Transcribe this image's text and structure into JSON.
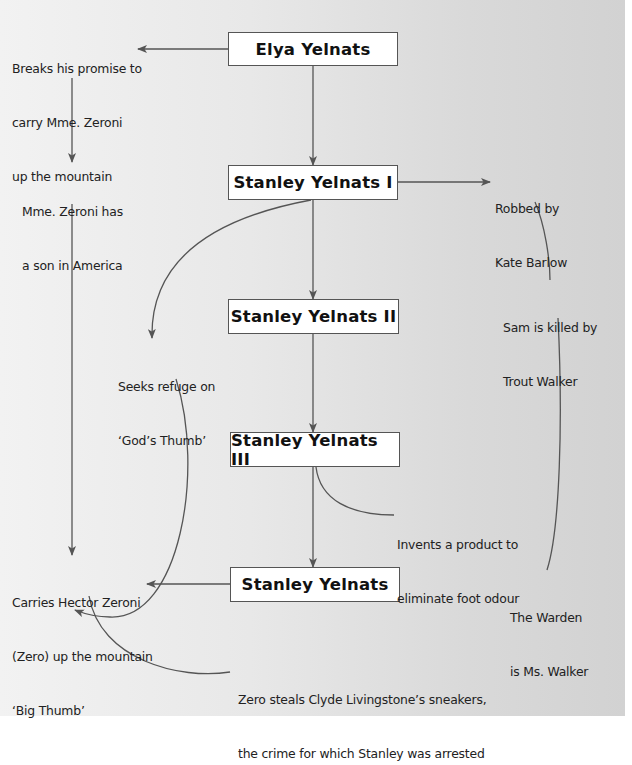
{
  "diagram": {
    "type": "family-tree-flowchart",
    "colors": {
      "background_light": "#f2f2f2",
      "background_dark": "#d2d2d2",
      "box_fill": "#ffffff",
      "box_border": "#555555",
      "line": "#555555",
      "text": "#222222"
    },
    "generations": [
      {
        "id": "elya",
        "label": "Elya Yelnats"
      },
      {
        "id": "sy1",
        "label": "Stanley Yelnats I"
      },
      {
        "id": "sy2",
        "label": "Stanley Yelnats II"
      },
      {
        "id": "sy3",
        "label": "Stanley Yelnats III"
      },
      {
        "id": "sy4",
        "label": "Stanley Yelnats"
      }
    ],
    "notes": {
      "breaks_promise": [
        "Breaks his promise to",
        "carry Mme. Zeroni",
        "up the mountain"
      ],
      "son_in_america": [
        "Mme. Zeroni has",
        "a son in America"
      ],
      "carries_hector": [
        "Carries Hector Zeroni",
        "(Zero) up the mountain",
        "‘Big Thumb’"
      ],
      "robbed": [
        "Robbed by",
        "Kate Barlow"
      ],
      "seeks_refuge": [
        "Seeks refuge on",
        "‘God’s Thumb’"
      ],
      "sam_killed": [
        "Sam is killed by",
        "Trout Walker"
      ],
      "invents_product": [
        "Invents a product to",
        "eliminate foot odour"
      ],
      "warden": [
        "The Warden",
        "is Ms. Walker"
      ],
      "zero_steals": [
        "Zero steals Clyde Livingstone’s sneakers,",
        "the crime for which Stanley was arrested"
      ]
    },
    "connections": [
      {
        "from": "Elya Yelnats",
        "to": "Breaks his promise to carry Mme. Zeroni up the mountain",
        "style": "arrow"
      },
      {
        "from": "Breaks his promise to carry Mme. Zeroni up the mountain",
        "to": "Mme. Zeroni has a son in America",
        "style": "arrow"
      },
      {
        "from": "Mme. Zeroni has a son in America",
        "to": "Carries Hector Zeroni (Zero) up the mountain ‘Big Thumb’",
        "style": "arrow"
      },
      {
        "from": "Elya Yelnats",
        "to": "Stanley Yelnats I",
        "style": "arrow"
      },
      {
        "from": "Stanley Yelnats I",
        "to": "Robbed by Kate Barlow",
        "style": "arrow"
      },
      {
        "from": "Stanley Yelnats I",
        "to": "Seeks refuge on ‘God’s Thumb’",
        "style": "curved-arrow"
      },
      {
        "from": "Stanley Yelnats I",
        "to": "Stanley Yelnats II",
        "style": "arrow"
      },
      {
        "from": "Stanley Yelnats II",
        "to": "Stanley Yelnats III",
        "style": "arrow"
      },
      {
        "from": "Stanley Yelnats III",
        "to": "Invents a product to eliminate foot odour",
        "style": "curve"
      },
      {
        "from": "Stanley Yelnats III",
        "to": "Stanley Yelnats",
        "style": "arrow"
      },
      {
        "from": "Stanley Yelnats",
        "to": "Carries Hector Zeroni (Zero) up the mountain ‘Big Thumb’",
        "style": "arrow"
      },
      {
        "from": "Seeks refuge on ‘God’s Thumb’",
        "to": "Carries Hector Zeroni (Zero) up the mountain ‘Big Thumb’",
        "style": "curved-arrow"
      },
      {
        "from": "Carries Hector Zeroni (Zero) up the mountain ‘Big Thumb’",
        "to": "Zero steals Clyde Livingstone’s sneakers, the crime for which Stanley was arrested",
        "style": "curve"
      },
      {
        "from": "Robbed by Kate Barlow",
        "to": "Sam is killed by Trout Walker",
        "style": "curve"
      },
      {
        "from": "Sam is killed by Trout Walker",
        "to": "The Warden is Ms. Walker",
        "style": "curve"
      }
    ]
  }
}
